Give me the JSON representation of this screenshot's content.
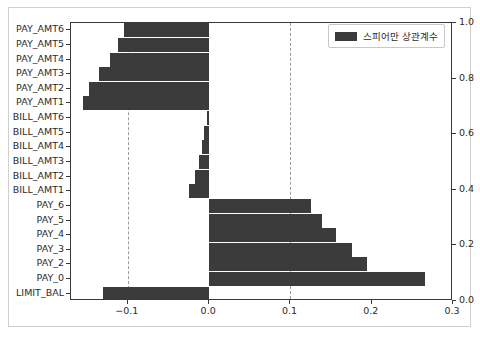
{
  "chart_data": {
    "type": "bar",
    "orientation": "horizontal",
    "title": "",
    "xlabel": "",
    "ylabel": "",
    "categories": [
      "PAY_AMT6",
      "PAY_AMT5",
      "PAY_AMT4",
      "PAY_AMT3",
      "PAY_AMT2",
      "PAY_AMT1",
      "BILL_AMT6",
      "BILL_AMT5",
      "BILL_AMT4",
      "BILL_AMT3",
      "BILL_AMT2",
      "BILL_AMT1",
      "PAY_6",
      "PAY_5",
      "PAY_4",
      "PAY_3",
      "PAY_2",
      "PAY_0",
      "LIMIT_BAL"
    ],
    "values": [
      -0.105,
      -0.112,
      -0.122,
      -0.135,
      -0.148,
      -0.155,
      -0.003,
      -0.006,
      -0.009,
      -0.013,
      -0.017,
      -0.025,
      0.125,
      0.139,
      0.156,
      0.176,
      0.194,
      0.265,
      -0.131
    ],
    "series": [
      {
        "name": "스피어만 상관계수",
        "color": "#3b3b3b",
        "values": [
          -0.105,
          -0.112,
          -0.122,
          -0.135,
          -0.148,
          -0.155,
          -0.003,
          -0.006,
          -0.009,
          -0.013,
          -0.017,
          -0.025,
          0.125,
          0.139,
          0.156,
          0.176,
          0.194,
          0.265,
          -0.131
        ]
      }
    ],
    "xlim": [
      -0.17,
      0.3
    ],
    "xticks": [
      -0.1,
      0.0,
      0.1,
      0.2,
      0.3
    ],
    "xticklabels": [
      "−0.1",
      "0.0",
      "0.1",
      "0.2",
      "0.3"
    ],
    "reference_lines": [
      -0.1,
      0.1
    ],
    "reference_line_style": "dashed",
    "right_axis": {
      "ticks": [
        0.0,
        0.2,
        0.4,
        0.6,
        0.8,
        1.0
      ],
      "ticklabels": [
        "0.0",
        "0.2",
        "0.4",
        "0.6",
        "0.8",
        "1.0"
      ],
      "ylim": [
        0.0,
        1.0
      ]
    },
    "grid": false,
    "legend": {
      "position": "upper right",
      "entries": [
        {
          "label": "스피어만 상관계수",
          "color": "#3b3b3b"
        }
      ]
    }
  },
  "legend": {
    "label": "스피어만 상관계수"
  },
  "axes": {
    "x_ticklabels": [
      "−0.1",
      "0.0",
      "0.1",
      "0.2",
      "0.3"
    ],
    "right_ticklabels": [
      "0.0",
      "0.2",
      "0.4",
      "0.6",
      "0.8",
      "1.0"
    ]
  }
}
